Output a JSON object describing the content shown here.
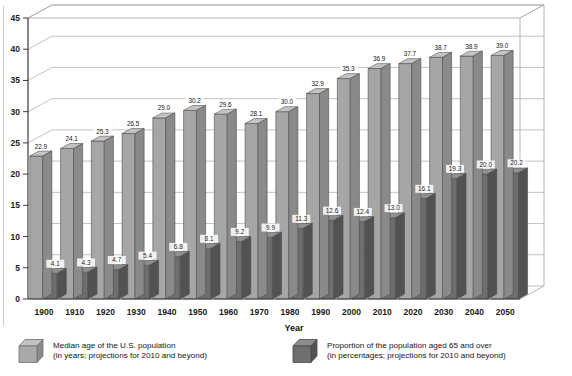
{
  "chart_data": {
    "type": "bar",
    "title": "",
    "subtitle": "",
    "xlabel": "Year",
    "ylabel": "",
    "ylim": [
      0,
      45
    ],
    "ytick_step": 5,
    "yticks": [
      "0",
      "5",
      "10",
      "15",
      "20",
      "25",
      "30",
      "35",
      "40",
      "45"
    ],
    "grid": true,
    "grid_axis": "y",
    "legend_position": "bottom",
    "three_d": true,
    "categories": [
      "1900",
      "1910",
      "1920",
      "1930",
      "1940",
      "1950",
      "1960",
      "1970",
      "1980",
      "1990",
      "2000",
      "2010",
      "2020",
      "2030",
      "2040",
      "2050"
    ],
    "series": [
      {
        "name": "Median age of the U.S. population",
        "units": "years",
        "color": "#a6a6a6",
        "top_color": "#c4c4c4",
        "side_color": "#8a8a8a",
        "values": [
          22.9,
          24.1,
          25.3,
          26.5,
          29.0,
          30.2,
          29.6,
          28.1,
          30.0,
          32.9,
          35.3,
          36.9,
          37.7,
          38.7,
          38.9,
          39.0
        ],
        "labels": [
          "22.9",
          "24.1",
          "25.3",
          "26.5",
          "29.0",
          "30.2",
          "29.6",
          "28.1",
          "30.0",
          "32.9",
          "35.3",
          "36.9",
          "37.7",
          "38.7",
          "38.9",
          "39.0"
        ]
      },
      {
        "name": "Proportion of the population aged 65 and over",
        "units": "percentages",
        "color": "#6e6e6e",
        "top_color": "#909090",
        "side_color": "#525252",
        "values": [
          4.1,
          4.3,
          4.7,
          5.4,
          6.8,
          8.1,
          9.2,
          9.9,
          11.3,
          12.6,
          12.4,
          13.0,
          16.1,
          19.3,
          20.0,
          20.2
        ],
        "labels": [
          "4.1",
          "4.3",
          "4.7",
          "5.4",
          "6.8",
          "8.1",
          "9.2",
          "9.9",
          "11.3",
          "12.6",
          "12.4",
          "13.0",
          "16.1",
          "19.3",
          "20.0",
          "20.2"
        ]
      }
    ]
  },
  "legend": {
    "items": [
      {
        "line1": "Median age of the U.S. population",
        "line2": "(in years; projections for 2010 and beyond)",
        "swatch": "light-gray-cube"
      },
      {
        "line1": "Proportion of the population aged 65 and over",
        "line2": "(in percentages; projections for 2010 and beyond)",
        "swatch": "dark-gray-cube"
      }
    ]
  },
  "axis": {
    "x_title": "Year"
  },
  "colors": {
    "series1_front": "#a6a6a6",
    "series1_top": "#c4c4c4",
    "series1_side": "#8a8a8a",
    "series2_front": "#6e6e6e",
    "series2_top": "#909090",
    "series2_side": "#525252",
    "grid": "#a8a8a8",
    "axis": "#3a3a3a",
    "background": "#ffffff"
  }
}
